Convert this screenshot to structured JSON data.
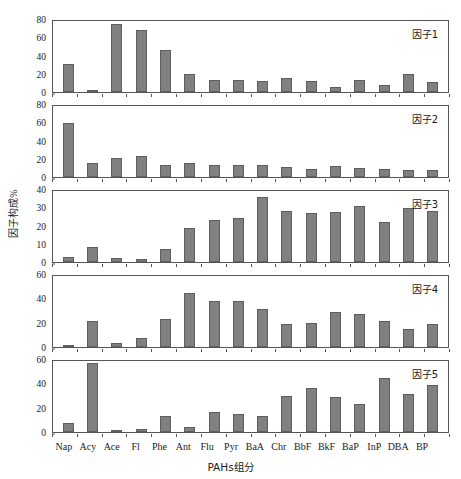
{
  "chart_data": {
    "type": "bar",
    "title": "",
    "xlabel": "PAHs组分",
    "ylabel": "因子构成%",
    "grid": false,
    "legend": "none",
    "layout": "5 stacked subpanels sharing one x axis",
    "categories": [
      "Nap",
      "Acy",
      "Ace",
      "Fl",
      "Phe",
      "Ant",
      "Flu",
      "Pyr",
      "BaA",
      "Chr",
      "BbF",
      "BkF",
      "BaP",
      "InP",
      "DBA",
      "BP"
    ],
    "panels": [
      {
        "tag": "因子1",
        "ylim": [
          0,
          80
        ],
        "yticks": [
          0,
          20,
          40,
          60,
          80
        ],
        "values": [
          31,
          2,
          74,
          68,
          46,
          20,
          13,
          13.5,
          12,
          15.5,
          12,
          5,
          13,
          8,
          20,
          10.5
        ]
      },
      {
        "tag": "因子2",
        "ylim": [
          0,
          80
        ],
        "yticks": [
          0,
          20,
          40,
          60,
          80
        ],
        "values": [
          59,
          15,
          21,
          23,
          13,
          15.5,
          13,
          13,
          13,
          11,
          8.5,
          12,
          9.5,
          8.5,
          7.5,
          7.5
        ]
      },
      {
        "tag": "因子3",
        "ylim": [
          0,
          40
        ],
        "yticks": [
          0,
          10,
          20,
          30,
          40
        ],
        "values": [
          3,
          8,
          2.3,
          1.5,
          7,
          18.5,
          23,
          24,
          35.5,
          28,
          26.8,
          27.5,
          30.8,
          22,
          29.8,
          28
        ]
      },
      {
        "tag": "因子4",
        "ylim": [
          0,
          60
        ],
        "yticks": [
          0,
          20,
          40,
          60
        ],
        "values": [
          1,
          21,
          3,
          7.5,
          23,
          44.8,
          37.8,
          37.8,
          31,
          18.8,
          19.5,
          29,
          27.5,
          21.5,
          15,
          19
        ]
      },
      {
        "tag": "因子5",
        "ylim": [
          0,
          60
        ],
        "yticks": [
          0,
          20,
          40,
          60
        ],
        "values": [
          7.5,
          57,
          1.5,
          2.5,
          13.5,
          4.3,
          16.3,
          15,
          13,
          29.8,
          36.3,
          29,
          23,
          44.5,
          31.3,
          39
        ]
      }
    ],
    "colors": {
      "bar_fill": "#808080",
      "bar_edge": "#5e5e5e",
      "axis": "#555555",
      "background": "#ffffff",
      "text": "#1a1a1a"
    }
  }
}
